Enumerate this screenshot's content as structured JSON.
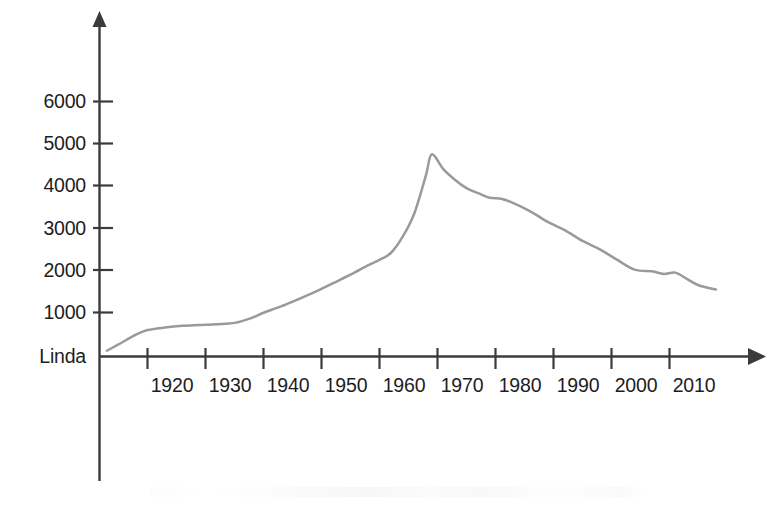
{
  "chart_data": {
    "type": "line",
    "title": "",
    "subtitle": "",
    "xlabel": "",
    "ylabel": "",
    "origin_label": "Linda",
    "series_name": "Linda",
    "line_color": "#9a9a9a",
    "axis_color": "#3b3b3b",
    "grid": false,
    "legend": "none",
    "xlim": [
      1913,
      2018
    ],
    "ylim": [
      0,
      6600
    ],
    "x_ticks": [
      1920,
      1930,
      1940,
      1950,
      1960,
      1970,
      1980,
      1990,
      2000,
      2010
    ],
    "x_tick_labels": [
      "1920",
      "1930",
      "1940",
      "1950",
      "1960",
      "1970",
      "1980",
      "1990",
      "2000",
      "2010"
    ],
    "y_ticks": [
      1000,
      2000,
      3000,
      4000,
      5000,
      6000
    ],
    "y_tick_labels": [
      "1000",
      "2000",
      "3000",
      "4000",
      "5000",
      "6000"
    ],
    "x": [
      1913,
      1915,
      1918,
      1920,
      1923,
      1926,
      1929,
      1932,
      1935,
      1938,
      1940,
      1943,
      1946,
      1949,
      1952,
      1955,
      1958,
      1960,
      1962,
      1964,
      1966,
      1968,
      1969,
      1971,
      1973,
      1975,
      1977,
      1979,
      1981,
      1983,
      1986,
      1989,
      1992,
      1995,
      1998,
      2001,
      2004,
      2007,
      2009,
      2011,
      2013,
      2015,
      2018
    ],
    "values": [
      100,
      250,
      480,
      590,
      650,
      690,
      710,
      730,
      760,
      880,
      1000,
      1150,
      1320,
      1500,
      1700,
      1900,
      2120,
      2250,
      2420,
      2800,
      3350,
      4250,
      4750,
      4400,
      4150,
      3950,
      3830,
      3720,
      3700,
      3600,
      3400,
      3150,
      2950,
      2700,
      2500,
      2250,
      2020,
      1980,
      1920,
      1950,
      1800,
      1650,
      1550
    ],
    "peak": {
      "x": 1969,
      "value": 4750
    },
    "end_value": 1550,
    "start_value": 100
  },
  "axes": {
    "y_axis_name": "vertical-axis",
    "x_axis_name": "horizontal-axis",
    "y_arrow": "up-arrow",
    "x_arrow": "right-arrow"
  }
}
